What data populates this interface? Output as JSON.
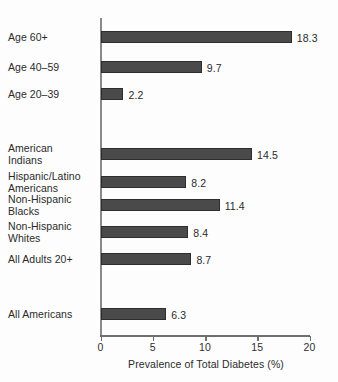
{
  "chart_data": {
    "type": "bar",
    "orientation": "horizontal",
    "title": "",
    "xlabel": "Prevalence of Total Diabetes (%)",
    "ylabel": "",
    "xlim": [
      0,
      20
    ],
    "xticks": [
      0,
      5,
      10,
      15,
      20
    ],
    "xtick_labels": [
      "0",
      "5",
      "10",
      "15",
      "20"
    ],
    "grid": false,
    "legend": null,
    "bar_color": "#4a4a4a",
    "bar_edge_color": "#2e2e2e",
    "background_color": "#fdfdfd",
    "axis_color": "#6f6f6f",
    "categories": [
      "Age 60+",
      "Age 40–59",
      "Age 20–39",
      "American Indians",
      "Hispanic/Latino Americans",
      "Non-Hispanic Blacks",
      "Non-Hispanic Whites",
      "All Adults 20+",
      "All Americans"
    ],
    "values": [
      18.3,
      9.7,
      2.2,
      14.5,
      8.2,
      11.4,
      8.4,
      8.7,
      6.3
    ],
    "data_labels": [
      "18.3",
      "9.7",
      "2.2",
      "14.5",
      "8.2",
      "11.4",
      "8.4",
      "8.7",
      "6.3"
    ],
    "groups": [
      {
        "name": "age",
        "categories": [
          "Age 60+",
          "Age 40–59",
          "Age 20–39"
        ]
      },
      {
        "name": "race-ethnicity-and-adults",
        "categories": [
          "American Indians",
          "Hispanic/Latino Americans",
          "Non-Hispanic Blacks",
          "Non-Hispanic Whites",
          "All Adults 20+"
        ]
      },
      {
        "name": "overall",
        "categories": [
          "All Americans"
        ]
      }
    ]
  },
  "bars": [
    {
      "label_line1": "Age 60+",
      "label_line2": "",
      "value": 18.3,
      "data_label": "18.3",
      "top": 31,
      "label_top": 32
    },
    {
      "label_line1": "Age 40–59",
      "label_line2": "",
      "value": 9.7,
      "data_label": "9.7",
      "top": 61,
      "label_top": 62
    },
    {
      "label_line1": "Age 20–39",
      "label_line2": "",
      "value": 2.2,
      "data_label": "2.2",
      "top": 88,
      "label_top": 89
    },
    {
      "label_line1": "American",
      "label_line2": "Indians",
      "value": 14.5,
      "data_label": "14.5",
      "top": 148,
      "label_top": 143
    },
    {
      "label_line1": "Hispanic/Latino",
      "label_line2": "Americans",
      "value": 8.2,
      "data_label": "8.2",
      "top": 176,
      "label_top": 171
    },
    {
      "label_line1": "Non-Hispanic",
      "label_line2": "Blacks",
      "value": 11.4,
      "data_label": "11.4",
      "top": 199,
      "label_top": 194
    },
    {
      "label_line1": "Non-Hispanic",
      "label_line2": "Whites",
      "value": 8.4,
      "data_label": "8.4",
      "top": 226,
      "label_top": 221
    },
    {
      "label_line1": "All Adults 20+",
      "label_line2": "",
      "value": 8.7,
      "data_label": "8.7",
      "top": 253,
      "label_top": 254
    },
    {
      "label_line1": "All Americans",
      "label_line2": "",
      "value": 6.3,
      "data_label": "6.3",
      "top": 308,
      "label_top": 309
    }
  ],
  "axis": {
    "title": "Prevalence of Total Diabetes (%)",
    "ticks": [
      {
        "label": "0",
        "value": 0
      },
      {
        "label": "5",
        "value": 5
      },
      {
        "label": "10",
        "value": 10
      },
      {
        "label": "15",
        "value": 15
      },
      {
        "label": "20",
        "value": 20
      }
    ]
  }
}
